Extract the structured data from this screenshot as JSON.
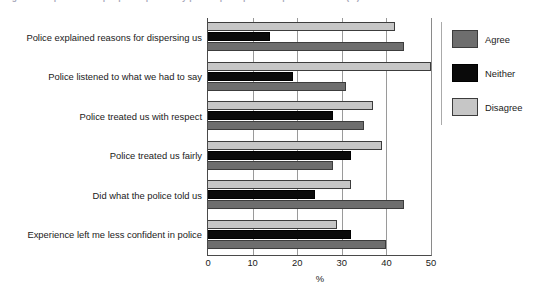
{
  "figure": {
    "caption": "Figure 3: Experience of people dispersed by police: perceptions of police conduct (%)"
  },
  "chart_data": {
    "type": "bar",
    "orientation": "horizontal",
    "title": "",
    "xlabel": "%",
    "ylabel": "",
    "xlim": [
      0,
      50
    ],
    "xticks": [
      "0",
      "10",
      "20",
      "30",
      "40",
      "50"
    ],
    "grid": true,
    "legend_position": "right",
    "categories": [
      "Experience left me less confident in police",
      "Did what the police told us",
      "Police treated us fairly",
      "Police treated us with respect",
      "Police listened to what we had to say",
      "Police explained reasons for dispersing us"
    ],
    "series": [
      {
        "name": "Agree",
        "color": "#6e6e6e",
        "values": [
          40,
          44,
          28,
          35,
          31,
          44
        ]
      },
      {
        "name": "Neither",
        "color": "#0a0a0a",
        "values": [
          32,
          24,
          32,
          28,
          19,
          14
        ]
      },
      {
        "name": "Disagree",
        "color": "#c6c6c6",
        "values": [
          29,
          32,
          39,
          37,
          50,
          42
        ]
      }
    ]
  }
}
